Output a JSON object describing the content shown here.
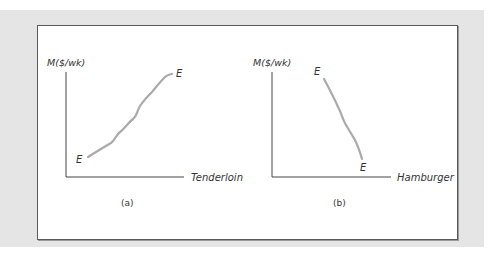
{
  "figure": {
    "panels": [
      {
        "id": "a",
        "caption": "(a)",
        "y_axis_label": "M($/wk)",
        "x_axis_label": "Tenderloin",
        "curve_label_start": "E",
        "curve_label_end": "E",
        "curve_direction": "upward-sloping"
      },
      {
        "id": "b",
        "caption": "(b)",
        "y_axis_label": "M($/wk)",
        "x_axis_label": "Hamburger",
        "curve_label_start": "E",
        "curve_label_end": "E",
        "curve_direction": "downward-sloping"
      }
    ],
    "colors": {
      "background": "#e5e5e5",
      "frame": "#ffffff",
      "border": "#5a5a5a",
      "axis": "#444444",
      "curve": "#aaaaaa",
      "text": "#333333"
    }
  }
}
